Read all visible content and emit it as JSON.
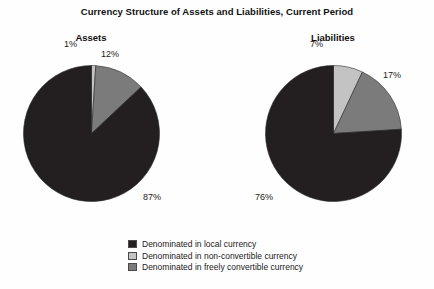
{
  "chart_data": {
    "type": "pie",
    "title": "Currency Structure of Assets and Liabilities, Current Period",
    "xlabel": "",
    "ylabel": "",
    "legend_position": "bottom",
    "grid": false,
    "colors": {
      "local": "#231f20",
      "non_convertible": "#c3c3c3",
      "freely_convertible": "#7b7b7b",
      "background": "#fefefe",
      "text": "#1a1a1a"
    },
    "categories": [
      "Denominated in local currency",
      "Denominated in non-convertible currency",
      "Denominated in freely convertible currency"
    ],
    "panels": [
      {
        "name": "assets",
        "title": "Assets",
        "values": [
          87,
          1,
          12
        ],
        "labels": [
          "87%",
          "1%",
          "12%"
        ]
      },
      {
        "name": "liabilities",
        "title": "Liabilities",
        "values": [
          76,
          7,
          17
        ],
        "labels": [
          "76%",
          "7%",
          "17%"
        ]
      }
    ]
  },
  "header": {
    "title": "Currency Structure of Assets and Liabilities, Current Period"
  },
  "panels": {
    "assets": {
      "title": "Assets",
      "pct_local": "87%",
      "pct_freely": "12%",
      "pct_nonconv": "1%"
    },
    "liabilities": {
      "title": "Liabilities",
      "pct_local": "76%",
      "pct_freely": "17%",
      "pct_nonconv": "7%"
    }
  },
  "legend": {
    "items": [
      {
        "label": "Denominated in local currency",
        "color": "#231f20"
      },
      {
        "label": "Denominated in non-convertible currency",
        "color": "#c3c3c3"
      },
      {
        "label": "Denominated in freely convertible currency",
        "color": "#7b7b7b"
      }
    ]
  }
}
